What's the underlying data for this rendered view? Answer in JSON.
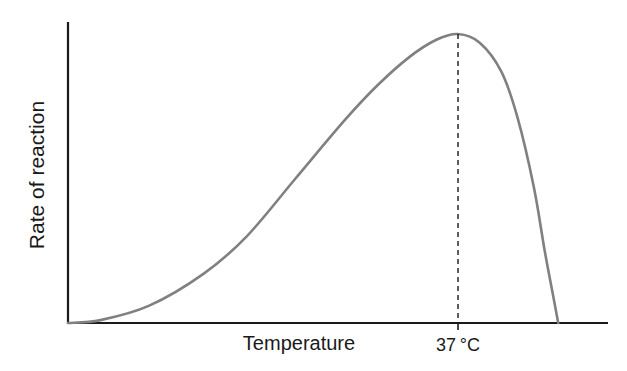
{
  "chart_data": {
    "type": "line",
    "title": "",
    "xlabel": "Temperature",
    "ylabel": "Rate of reaction",
    "grid": false,
    "legend": "none",
    "xlim": [
      0,
      100
    ],
    "ylim": [
      0,
      100
    ],
    "annotations": [
      {
        "label": "37 °C",
        "x": 72,
        "type": "dashed-vertical-line-at-peak"
      }
    ],
    "series": [
      {
        "name": "Rate of reaction",
        "color": "#808080",
        "x": [
          0,
          6,
          15,
          25,
          33,
          42,
          51,
          57,
          63,
          68,
          72,
          76,
          80,
          83,
          86,
          88,
          89.5,
          90.5
        ],
        "y": [
          0,
          1,
          6,
          17,
          30,
          50,
          70,
          82,
          92,
          98,
          100,
          97,
          87,
          71,
          47,
          25,
          10,
          0
        ]
      }
    ]
  }
}
